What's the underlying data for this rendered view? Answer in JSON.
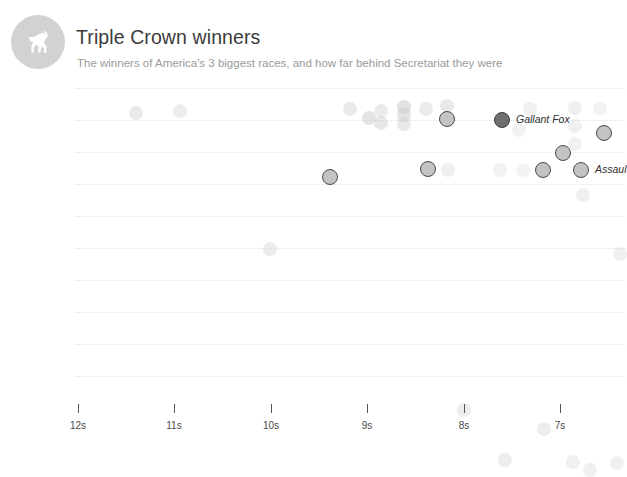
{
  "header": {
    "logo_icon": "horse-icon",
    "title": "Triple Crown winners",
    "subtitle": "The winners of America's 3 biggest races, and how far behind Secretariat they were"
  },
  "chart_data": {
    "type": "scatter",
    "title": "Triple Crown winners",
    "subtitle": "The winners of America's 3 biggest races, and how far behind Secretariat they were",
    "xlabel": "",
    "ylabel": "",
    "grid": true,
    "legend_position": "none",
    "x_axis": {
      "reversed": true,
      "tick_labels": [
        "12s",
        "11s",
        "10s",
        "9s",
        "8s",
        "7s"
      ],
      "tick_values": [
        12,
        11,
        10,
        9,
        8,
        7
      ],
      "tick_px": [
        78,
        174,
        271,
        367,
        464,
        560
      ],
      "unit": "s"
    },
    "y_axis": {
      "gridline_px": [
        6,
        38,
        70,
        102,
        134,
        166,
        198,
        230,
        262,
        294
      ]
    },
    "annotations": [
      {
        "label": "Gallant Fox",
        "x_px": 503,
        "y_px": 38
      },
      {
        "label": "Assaul",
        "x_px": 582,
        "y_px": 88
      }
    ],
    "points": [
      {
        "x_px": 136,
        "y_px": 31,
        "r": 7,
        "style": "plain",
        "opacity": 0.45
      },
      {
        "x_px": 180,
        "y_px": 29,
        "r": 7,
        "style": "plain",
        "opacity": 0.38
      },
      {
        "x_px": 350,
        "y_px": 27,
        "r": 7,
        "style": "plain",
        "opacity": 0.42
      },
      {
        "x_px": 369,
        "y_px": 36,
        "r": 7,
        "style": "plain",
        "opacity": 0.55
      },
      {
        "x_px": 381,
        "y_px": 29,
        "r": 7,
        "style": "plain",
        "opacity": 0.4
      },
      {
        "x_px": 381,
        "y_px": 41,
        "r": 7,
        "style": "plain",
        "opacity": 0.48
      },
      {
        "x_px": 404,
        "y_px": 25,
        "r": 7,
        "style": "plain",
        "opacity": 0.62
      },
      {
        "x_px": 404,
        "y_px": 33,
        "r": 7,
        "style": "plain",
        "opacity": 0.58
      },
      {
        "x_px": 404,
        "y_px": 42,
        "r": 7,
        "style": "plain",
        "opacity": 0.46
      },
      {
        "x_px": 426,
        "y_px": 27,
        "r": 7,
        "style": "plain",
        "opacity": 0.4
      },
      {
        "x_px": 447,
        "y_px": 24,
        "r": 7,
        "style": "plain",
        "opacity": 0.44
      },
      {
        "x_px": 447,
        "y_px": 37,
        "r": 8,
        "style": "ring",
        "opacity": 1
      },
      {
        "x_px": 502,
        "y_px": 38,
        "r": 8,
        "style": "ring-dark",
        "opacity": 1
      },
      {
        "x_px": 530,
        "y_px": 27,
        "r": 7,
        "style": "plain",
        "opacity": 0.3
      },
      {
        "x_px": 519,
        "y_px": 48,
        "r": 7,
        "style": "plain",
        "opacity": 0.26
      },
      {
        "x_px": 575,
        "y_px": 26,
        "r": 7,
        "style": "plain",
        "opacity": 0.32
      },
      {
        "x_px": 600,
        "y_px": 27,
        "r": 7,
        "style": "plain",
        "opacity": 0.24
      },
      {
        "x_px": 604,
        "y_px": 51,
        "r": 8,
        "style": "ring",
        "opacity": 1
      },
      {
        "x_px": 575,
        "y_px": 44,
        "r": 7,
        "style": "plain",
        "opacity": 0.3
      },
      {
        "x_px": 563,
        "y_px": 71,
        "r": 8,
        "style": "ring",
        "opacity": 1
      },
      {
        "x_px": 575,
        "y_px": 62,
        "r": 7,
        "style": "plain",
        "opacity": 0.28
      },
      {
        "x_px": 330,
        "y_px": 95,
        "r": 8,
        "style": "ring",
        "opacity": 1
      },
      {
        "x_px": 428,
        "y_px": 87,
        "r": 8,
        "style": "ring",
        "opacity": 1
      },
      {
        "x_px": 448,
        "y_px": 88,
        "r": 7,
        "style": "plain",
        "opacity": 0.3
      },
      {
        "x_px": 500,
        "y_px": 88,
        "r": 7,
        "style": "plain",
        "opacity": 0.26
      },
      {
        "x_px": 523,
        "y_px": 88,
        "r": 7,
        "style": "plain",
        "opacity": 0.24
      },
      {
        "x_px": 543,
        "y_px": 88,
        "r": 8,
        "style": "ring",
        "opacity": 1
      },
      {
        "x_px": 581,
        "y_px": 88,
        "r": 8,
        "style": "ring",
        "opacity": 1
      },
      {
        "x_px": 583,
        "y_px": 113,
        "r": 7,
        "style": "plain",
        "opacity": 0.3
      },
      {
        "x_px": 270,
        "y_px": 167,
        "r": 7,
        "style": "plain",
        "opacity": 0.38
      },
      {
        "x_px": 620,
        "y_px": 172,
        "r": 7,
        "style": "plain",
        "opacity": 0.3
      },
      {
        "x_px": 464,
        "y_px": 328,
        "r": 7,
        "style": "plain",
        "opacity": 0.36
      },
      {
        "x_px": 544,
        "y_px": 347,
        "r": 7,
        "style": "plain",
        "opacity": 0.34
      },
      {
        "x_px": 505,
        "y_px": 378,
        "r": 7,
        "style": "plain",
        "opacity": 0.36
      },
      {
        "x_px": 573,
        "y_px": 380,
        "r": 7,
        "style": "plain",
        "opacity": 0.32
      },
      {
        "x_px": 590,
        "y_px": 388,
        "r": 7,
        "style": "plain",
        "opacity": 0.3
      },
      {
        "x_px": 617,
        "y_px": 381,
        "r": 7,
        "style": "plain",
        "opacity": 0.3
      }
    ]
  },
  "axis_caption": ""
}
